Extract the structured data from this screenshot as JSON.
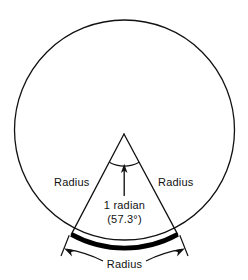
{
  "figure": {
    "colors": {
      "stroke": "#111111",
      "arc_highlight": "#000000",
      "background": "#ffffff",
      "text": "#111111"
    },
    "geometry": {
      "circle_center_x": 124.5,
      "circle_center_y": 130,
      "circle_radius": 110,
      "apex_x": 124,
      "apex_y": 134,
      "angle_degrees": 57.3,
      "half_angle_degrees": 28.65,
      "circle_stroke_width": 1.3,
      "radius_stroke_width": 1.3,
      "arc_highlight_stroke_width": 4.5
    },
    "labels": {
      "radius_left": "Radius",
      "radius_right": "Radius",
      "radius_bottom": "Radius",
      "angle_name": "1 radian",
      "angle_value": "(57.3°)"
    }
  }
}
